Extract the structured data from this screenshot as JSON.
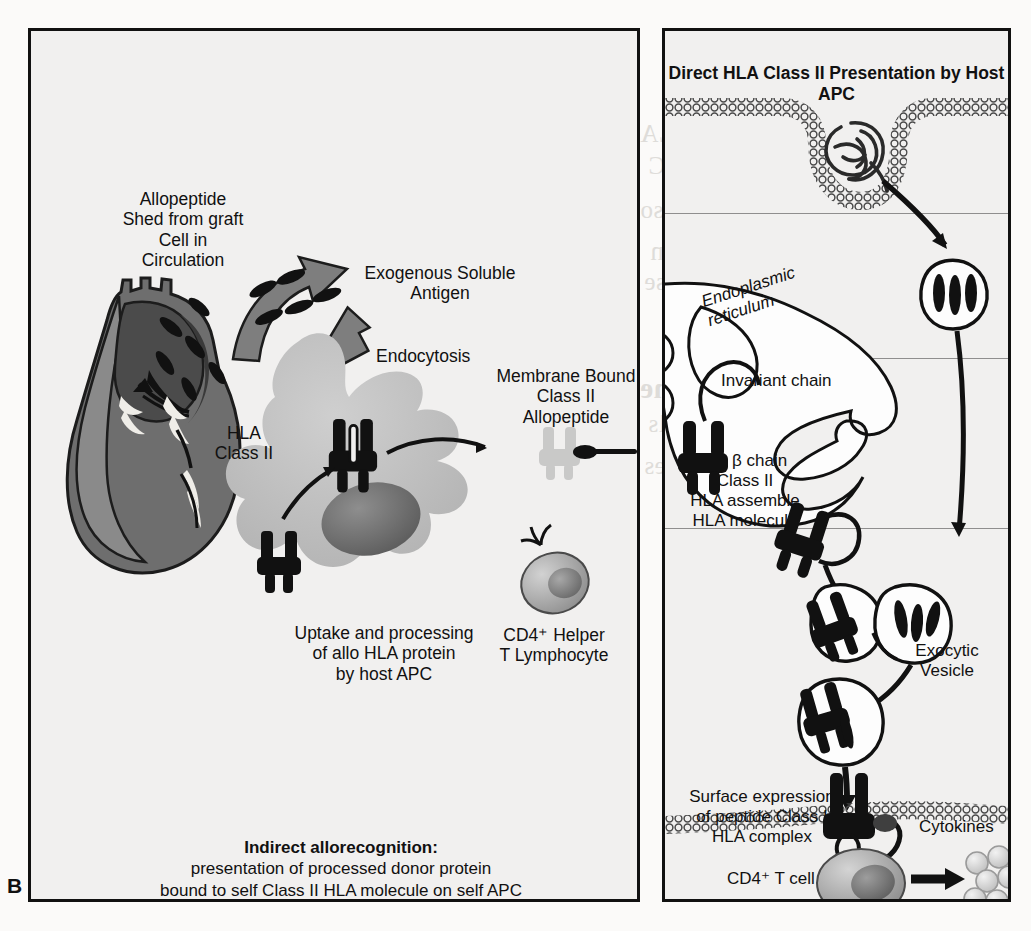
{
  "figure": {
    "panel_letter": "B",
    "background_color": "#f1f0ef",
    "ink_color": "#111111"
  },
  "left_panel": {
    "name": "indirect-allorecognition-panel",
    "labels": {
      "allopeptide_shed": "Allopeptide\nShed from graft\nCell in\nCirculation",
      "exogenous_antigen": "Exogenous Soluble\nAntigen",
      "endocytosis": "Endocytosis",
      "membrane_bound": "Membrane Bound\nClass II\nAllopeptide",
      "hla_class_ii": "HLA\nClass II",
      "uptake_processing": "Uptake and processing\nof allo HLA protein\nby host APC",
      "cd4_helper": "CD4⁺ Helper\nT Lymphocyte"
    },
    "caption": {
      "title": "Indirect allorecognition:",
      "line1": "presentation of processed donor protein",
      "line2": "bound to self Class II HLA molecule on self APC"
    },
    "graphics": [
      {
        "name": "donor-heart",
        "description": "dark grey transplanted heart"
      },
      {
        "name": "shed-peptide-arrow",
        "description": "curved grey block arrow from heart toward antigen"
      },
      {
        "name": "endocytosis-arrow",
        "description": "grey block arrow pointing into APC"
      },
      {
        "name": "allopeptide-particles",
        "description": "black teardrop peptide fragments"
      },
      {
        "name": "host-apc-cell",
        "description": "light grey amoeboid antigen presenting cell"
      },
      {
        "name": "cd4-t-lymphocyte",
        "description": "grey round lymphocyte with nucleus and surface receptor"
      },
      {
        "name": "mhc-class-ii-molecule",
        "description": "black twin-prong class II HLA molecule"
      }
    ]
  },
  "right_panel": {
    "name": "direct-hla-class-ii-presentation-panel",
    "title": "Direct HLA Class II\nPresentation by Host APC",
    "labels": {
      "endoplasmic_reticulum": "Endoplasmic\nreticulum",
      "invariant_chain": "Invariant chain",
      "alpha_beta": "α + β chain\nClass II\nHLA assemble\nHLA molecule",
      "exocytic_vesicle": "Exocytic\nVesicle",
      "surface_expression": "Surface expression\nof peptide Class I\nHLA complex",
      "cd4_t_cell": "CD4⁺ T cell",
      "cytokines": "Cytokines"
    },
    "graphics": [
      {
        "name": "plasma-membrane-bilayer",
        "description": "beaded lipid bilayer with invaginating endocytic pit"
      },
      {
        "name": "internalized-protein",
        "description": "tangled coiled antigen protein inside vesicle"
      },
      {
        "name": "endosome-vesicle",
        "description": "round vesicle carrying black peptide fragments"
      },
      {
        "name": "endoplasmic-reticulum-body",
        "description": "white ER lumen outline"
      },
      {
        "name": "exocytic-vesicle",
        "description": "vesicle bearing loaded class II molecule"
      },
      {
        "name": "cd4-t-cell-body",
        "description": "grey CD4 positive T cell with nucleus"
      },
      {
        "name": "cytokine-cluster",
        "description": "cluster of pale spheres representing cytokines"
      },
      {
        "name": "cytokine-arrow",
        "description": "black arrow from T cell to cytokines"
      }
    ]
  },
  "bleed_through": {
    "lines": [
      "immunity response. HLA",
      "complexes although APC",
      "and NK cells may also",
      "Direct Allorecognition",
      "are the major response",
      "of cells. Therefore, the",
      "stimulation of cells",
      "and NK's molecules",
      "The peptide HLA antigen",
      "Pathway",
      "Expression"
    ]
  }
}
